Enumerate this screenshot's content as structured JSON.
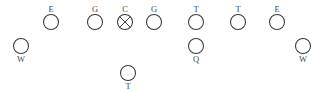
{
  "diagram": {
    "type": "american-football-formation",
    "width": 320,
    "height": 91,
    "background_color": "#ffffff",
    "stroke_color": "#3a3a3a",
    "label_color": "#4a4a4a",
    "circle_radius": 7.5,
    "players": [
      {
        "id": "left-end",
        "label": "E",
        "cx": 51,
        "cy": 22,
        "label_position": "above",
        "marker": "circle",
        "row": "line"
      },
      {
        "id": "left-guard",
        "label": "G",
        "cx": 95,
        "cy": 22,
        "label_position": "above",
        "marker": "circle",
        "row": "line"
      },
      {
        "id": "center",
        "label": "C",
        "cx": 125,
        "cy": 22,
        "label_position": "above",
        "marker": "crossed-circle",
        "row": "line"
      },
      {
        "id": "right-guard",
        "label": "G",
        "cx": 154,
        "cy": 22,
        "label_position": "above",
        "marker": "circle",
        "row": "line"
      },
      {
        "id": "left-tackle",
        "label": "T",
        "cx": 196,
        "cy": 22,
        "label_position": "above",
        "marker": "circle",
        "row": "line"
      },
      {
        "id": "right-tackle",
        "label": "T",
        "cx": 238,
        "cy": 22,
        "label_position": "above",
        "marker": "circle",
        "row": "line"
      },
      {
        "id": "right-end",
        "label": "E",
        "cx": 277,
        "cy": 22,
        "label_position": "above",
        "marker": "circle",
        "row": "line"
      },
      {
        "id": "left-wideout",
        "label": "W",
        "cx": 21,
        "cy": 46,
        "label_position": "below",
        "marker": "circle",
        "row": "wide"
      },
      {
        "id": "quarterback",
        "label": "Q",
        "cx": 196,
        "cy": 46,
        "label_position": "below",
        "marker": "circle",
        "row": "backfield"
      },
      {
        "id": "right-wideout",
        "label": "W",
        "cx": 303,
        "cy": 46,
        "label_position": "below",
        "marker": "circle",
        "row": "wide"
      },
      {
        "id": "tailback",
        "label": "T",
        "cx": 128,
        "cy": 73,
        "label_position": "below",
        "marker": "circle",
        "row": "backfield"
      }
    ]
  }
}
